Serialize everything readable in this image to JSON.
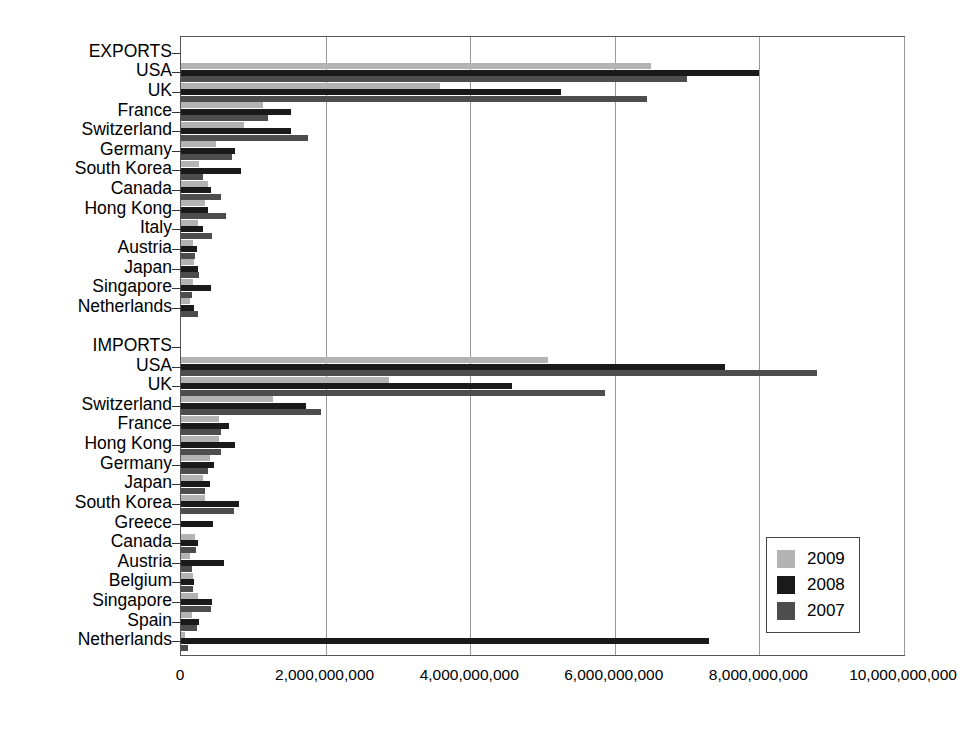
{
  "chart_data": {
    "type": "bar",
    "orientation": "horizontal",
    "title": "",
    "xlabel": "",
    "ylabel": "",
    "xlim": [
      0,
      10000000000
    ],
    "grid": true,
    "legend_position": "bottom-right",
    "xticks": [
      {
        "value": 0,
        "label": "0"
      },
      {
        "value": 2000000000,
        "label": "2,000,000,000"
      },
      {
        "value": 4000000000,
        "label": "4,000,000,000"
      },
      {
        "value": 6000000000,
        "label": "6,000,000,000"
      },
      {
        "value": 8000000000,
        "label": "8,000,000,000"
      },
      {
        "value": 10000000000,
        "label": "10,000,000,000"
      }
    ],
    "series": [
      {
        "name": "2009",
        "color": "#b3b3b3"
      },
      {
        "name": "2008",
        "color": "#1a1a1a"
      },
      {
        "name": "2007",
        "color": "#4d4d4d"
      }
    ],
    "groups": [
      {
        "name": "EXPORTS",
        "categories": [
          {
            "label": "EXPORTS",
            "header": true,
            "values": {
              "2009": 0,
              "2008": 0,
              "2007": 0
            }
          },
          {
            "label": "USA",
            "values": {
              "2009": 6500000000,
              "2008": 8000000000,
              "2007": 7000000000
            }
          },
          {
            "label": "UK",
            "values": {
              "2009": 3580000000,
              "2008": 5250000000,
              "2007": 6450000000
            }
          },
          {
            "label": "France",
            "values": {
              "2009": 1130000000,
              "2008": 1520000000,
              "2007": 1210000000
            }
          },
          {
            "label": "Switzerland",
            "values": {
              "2009": 870000000,
              "2008": 1520000000,
              "2007": 1760000000
            }
          },
          {
            "label": "Germany",
            "values": {
              "2009": 480000000,
              "2008": 740000000,
              "2007": 700000000
            }
          },
          {
            "label": "South Korea",
            "values": {
              "2009": 250000000,
              "2008": 830000000,
              "2007": 310000000
            }
          },
          {
            "label": "Canada",
            "values": {
              "2009": 380000000,
              "2008": 420000000,
              "2007": 560000000
            }
          },
          {
            "label": "Hong Kong",
            "values": {
              "2009": 330000000,
              "2008": 370000000,
              "2007": 620000000
            }
          },
          {
            "label": "Italy",
            "values": {
              "2009": 240000000,
              "2008": 310000000,
              "2007": 430000000
            }
          },
          {
            "label": "Austria",
            "values": {
              "2009": 170000000,
              "2008": 220000000,
              "2007": 200000000
            }
          },
          {
            "label": "Japan",
            "values": {
              "2009": 180000000,
              "2008": 230000000,
              "2007": 250000000
            }
          },
          {
            "label": "Singapore",
            "values": {
              "2009": 160000000,
              "2008": 420000000,
              "2007": 150000000
            }
          },
          {
            "label": "Netherlands",
            "values": {
              "2009": 130000000,
              "2008": 180000000,
              "2007": 230000000
            }
          }
        ]
      },
      {
        "name": "IMPORTS",
        "categories": [
          {
            "label": "IMPORTS",
            "header": true,
            "values": {
              "2009": 0,
              "2008": 0,
              "2007": 0
            }
          },
          {
            "label": "USA",
            "values": {
              "2009": 5070000000,
              "2008": 7520000000,
              "2007": 8800000000
            }
          },
          {
            "label": "UK",
            "values": {
              "2009": 2870000000,
              "2008": 4580000000,
              "2007": 5860000000
            }
          },
          {
            "label": "Switzerland",
            "values": {
              "2009": 1270000000,
              "2008": 1730000000,
              "2007": 1930000000
            }
          },
          {
            "label": "France",
            "values": {
              "2009": 530000000,
              "2008": 670000000,
              "2007": 560000000
            }
          },
          {
            "label": "Hong Kong",
            "values": {
              "2009": 530000000,
              "2008": 750000000,
              "2007": 560000000
            }
          },
          {
            "label": "Germany",
            "values": {
              "2009": 400000000,
              "2008": 460000000,
              "2007": 380000000
            }
          },
          {
            "label": "Japan",
            "values": {
              "2009": 310000000,
              "2008": 400000000,
              "2007": 330000000
            }
          },
          {
            "label": "South Korea",
            "values": {
              "2009": 330000000,
              "2008": 800000000,
              "2007": 730000000
            }
          },
          {
            "label": "Greece",
            "values": {
              "2009": 0,
              "2008": 440000000,
              "2007": 0
            }
          },
          {
            "label": "Canada",
            "values": {
              "2009": 200000000,
              "2008": 230000000,
              "2007": 210000000
            }
          },
          {
            "label": "Austria",
            "values": {
              "2009": 120000000,
              "2008": 600000000,
              "2007": 150000000
            }
          },
          {
            "label": "Belgium",
            "values": {
              "2009": 160000000,
              "2008": 180000000,
              "2007": 170000000
            }
          },
          {
            "label": "Singapore",
            "values": {
              "2009": 230000000,
              "2008": 430000000,
              "2007": 410000000
            }
          },
          {
            "label": "Spain",
            "values": {
              "2009": 150000000,
              "2008": 250000000,
              "2007": 220000000
            }
          },
          {
            "label": "Netherlands",
            "values": {
              "2009": 60000000,
              "2008": 7300000000,
              "2007": 100000000
            }
          }
        ]
      }
    ]
  },
  "legend": {
    "items": [
      {
        "label": "2009",
        "color": "#b3b3b3"
      },
      {
        "label": "2008",
        "color": "#1a1a1a"
      },
      {
        "label": "2007",
        "color": "#4d4d4d"
      }
    ]
  }
}
